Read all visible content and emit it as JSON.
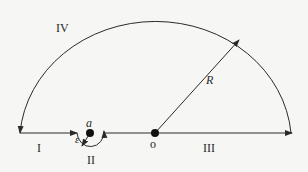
{
  "diagram": {
    "type": "contour-integration-path",
    "labels": {
      "segment_I": "I",
      "segment_II": "II",
      "segment_III": "III",
      "segment_IV": "IV",
      "radius": "R",
      "point_a": "a",
      "point_o": "o",
      "small_radius": "ε"
    },
    "elements": [
      {
        "name": "segment I",
        "desc": "straight line on real axis from -R to a-ε, arrow pointing right"
      },
      {
        "name": "segment II",
        "desc": "small semicircle of radius ε below point a, arrow ending upward at a+ε"
      },
      {
        "name": "segment III",
        "desc": "straight line on real axis from a+ε to R through o, arrow pointing right"
      },
      {
        "name": "segment IV",
        "desc": "large upper semicircle of radius R, arrow ending downward at -R"
      },
      {
        "name": "radius R",
        "desc": "arrow from o to the large arc"
      }
    ],
    "colors": {
      "stroke": "#2a2a2a",
      "background": "#f6f6f4"
    }
  }
}
